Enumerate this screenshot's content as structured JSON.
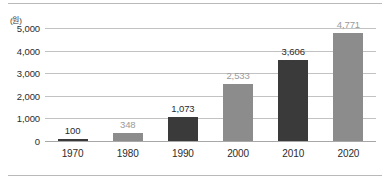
{
  "chart_data": {
    "type": "bar",
    "title": "",
    "subtitle": "",
    "unit_label": "(원)",
    "xlabel": "",
    "ylabel": "",
    "categories": [
      "1970",
      "1980",
      "1990",
      "2000",
      "2010",
      "2020"
    ],
    "values": [
      100,
      348,
      1073,
      2533,
      3606,
      4771
    ],
    "value_labels": [
      "100",
      "348",
      "1,073",
      "2,533",
      "3,606",
      "4,771"
    ],
    "bar_colors": [
      "#3a3a3a",
      "#8c8c8c",
      "#3a3a3a",
      "#8c8c8c",
      "#3a3a3a",
      "#8c8c8c"
    ],
    "label_colors": [
      "#2b2b2b",
      "#9a9a9a",
      "#2b2b2b",
      "#9a9a9a",
      "#2b2b2b",
      "#9a9a9a"
    ],
    "ylim": [
      0,
      5000
    ],
    "yticks": [
      0,
      1000,
      2000,
      3000,
      4000,
      5000
    ],
    "ytick_labels": [
      "0",
      "1,000",
      "2,000",
      "3,000",
      "4,000",
      "5,000"
    ],
    "grid": true,
    "legend": "none"
  },
  "frame": {
    "top_rule": "",
    "bottom_rule": ""
  }
}
